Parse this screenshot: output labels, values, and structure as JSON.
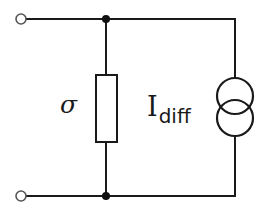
{
  "diagram": {
    "type": "circuit-schematic",
    "colors": {
      "wire": "#1a1a1a",
      "background": "#ffffff",
      "terminal_fill": "#ffffff"
    },
    "components": [
      {
        "id": "terminal-top",
        "kind": "open-terminal"
      },
      {
        "id": "terminal-bottom",
        "kind": "open-terminal"
      },
      {
        "id": "junction-top",
        "kind": "junction-dot"
      },
      {
        "id": "junction-bottom",
        "kind": "junction-dot"
      },
      {
        "id": "resistor",
        "kind": "resistor",
        "label": "σ"
      },
      {
        "id": "current-source",
        "kind": "current-source",
        "label_main": "I",
        "label_sub": "diff"
      }
    ],
    "labels": {
      "resistor": "σ",
      "current_source_main": "I",
      "current_source_sub": "diff"
    }
  }
}
